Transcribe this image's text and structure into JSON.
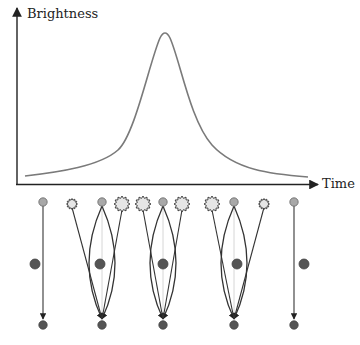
{
  "diagram": {
    "type": "microlensing light curve with lens configurations",
    "y_axis_label": "Brightness",
    "x_axis_label": "Time",
    "colors": {
      "axis": "#222222",
      "curve": "#777777",
      "source_star": "#a8a8a8",
      "lens_star": "#555555",
      "image_burst": "#e6e6e6",
      "ray": "#333333",
      "guide_line": "#cccccc"
    },
    "light_curve": {
      "shape": "symmetric peak",
      "start": [
        25,
        176
      ],
      "peak": [
        165,
        31
      ],
      "end": [
        308,
        177
      ]
    },
    "panels": [
      {
        "id": 1,
        "x": 43,
        "lens_x": 35,
        "lensing": false,
        "images": []
      },
      {
        "id": 2,
        "x": 102,
        "lens_x": 100,
        "lensing": true,
        "images": [
          {
            "x": 72,
            "size": "small"
          },
          {
            "x": 122,
            "size": "large"
          }
        ]
      },
      {
        "id": 3,
        "x": 163,
        "lens_x": 163,
        "lensing": true,
        "images": [
          {
            "x": 143,
            "size": "large"
          },
          {
            "x": 182,
            "size": "large"
          }
        ]
      },
      {
        "id": 4,
        "x": 234,
        "lens_x": 237,
        "lensing": true,
        "images": [
          {
            "x": 212,
            "size": "large"
          },
          {
            "x": 264,
            "size": "small"
          }
        ]
      },
      {
        "id": 5,
        "x": 294,
        "lens_x": 304,
        "lensing": false,
        "images": []
      }
    ]
  }
}
